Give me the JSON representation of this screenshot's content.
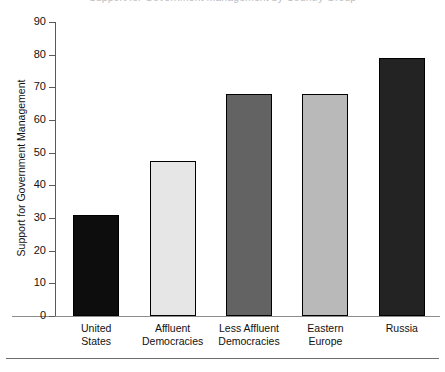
{
  "figure": {
    "cropped_title": "Support for Government Management by Country Group",
    "bottom_rule": "horizontal-rule"
  },
  "chart_data": {
    "type": "bar",
    "title": "",
    "xlabel": "",
    "ylabel": "Support for Government Management",
    "ylim": [
      0,
      90
    ],
    "yticks": [
      0,
      10,
      20,
      30,
      40,
      50,
      60,
      70,
      80,
      90
    ],
    "ytick_labels": [
      "0",
      "10",
      "20",
      "30",
      "40",
      "50",
      "60",
      "70",
      "80",
      "90"
    ],
    "grid": false,
    "legend": null,
    "categories": [
      "United States",
      "Affluent Democracies",
      "Less Affluent Democracies",
      "Eastern Europe",
      "Russia"
    ],
    "category_lines": [
      [
        "United",
        "States"
      ],
      [
        "Affluent",
        "Democracies"
      ],
      [
        "Less Affluent",
        "Democracies"
      ],
      [
        "Eastern",
        "Europe"
      ],
      [
        "Russia",
        ""
      ]
    ],
    "values": [
      31,
      47.5,
      68,
      68,
      79
    ],
    "bar_colors": [
      "#0d0d0d",
      "#e6e6e6",
      "#636363",
      "#b9b9b9",
      "#232323"
    ],
    "bar_edge_color": "#000000"
  }
}
